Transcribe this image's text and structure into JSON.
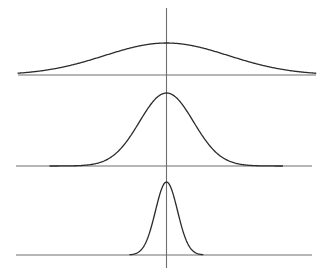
{
  "figure": {
    "width": 329,
    "height": 270,
    "background": "#ffffff",
    "title": "",
    "curve_color": "#2b2b2b",
    "axis_color": "#6e6e6e",
    "curve_stroke_width": 1.3,
    "axis_stroke_width": 1.1
  },
  "vertical_axis": {
    "x": 166.5,
    "y_top": 8,
    "y_bottom": 268
  },
  "chart_data": {
    "type": "line",
    "title": "",
    "subtitle": "",
    "xlabel": "",
    "ylabel": "",
    "grid": false,
    "legend": false,
    "legend_position": "none",
    "shared_mean_px": 166.5,
    "xlim": [
      0,
      329
    ],
    "ylim": [
      0,
      270
    ],
    "series": [
      {
        "name": "wide",
        "order": 1,
        "mean_px": 166.5,
        "sigma_px": 62,
        "peak_y_px": 43,
        "baseline_y_px": 75,
        "amplitude_px": 32,
        "baseline_x_start": 18,
        "baseline_x_end": 316,
        "curve_x_start": 18,
        "curve_x_end": 316,
        "relative_sigma": 1.0,
        "relative_peak_height": 1.0
      },
      {
        "name": "medium",
        "order": 2,
        "mean_px": 166.5,
        "sigma_px": 27,
        "peak_y_px": 93,
        "baseline_y_px": 166,
        "amplitude_px": 73,
        "baseline_x_start": 16,
        "baseline_x_end": 312,
        "curve_x_start": 50,
        "curve_x_end": 283,
        "relative_sigma": 0.435,
        "relative_peak_height": 2.28
      },
      {
        "name": "narrow",
        "order": 3,
        "mean_px": 166.5,
        "sigma_px": 11,
        "peak_y_px": 182,
        "baseline_y_px": 255,
        "amplitude_px": 73,
        "baseline_x_start": 16,
        "baseline_x_end": 312,
        "curve_x_start": 130,
        "curve_x_end": 203,
        "relative_sigma": 0.177,
        "relative_peak_height": 2.28
      }
    ]
  }
}
